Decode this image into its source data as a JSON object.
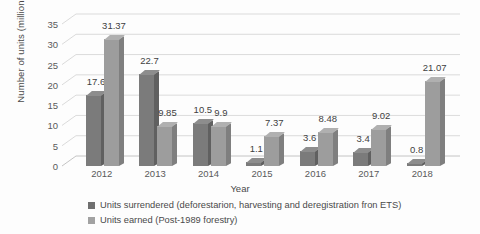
{
  "chart_data": {
    "type": "bar",
    "title": "",
    "xlabel": "Year",
    "ylabel": "Number of units (millions)",
    "categories": [
      "2012",
      "2013",
      "2014",
      "2015",
      "2016",
      "2017",
      "2018"
    ],
    "series": [
      {
        "name": "Units surrendered (deforestarion, harvesting and deregistration fron ETS)",
        "color": "#7b7b7b",
        "values": [
          17.6,
          22.7,
          10.5,
          1.1,
          3.6,
          3.4,
          0.8
        ],
        "labels": [
          "17.6",
          "22.7",
          "10.5",
          "1.1",
          "3.6",
          "3.4",
          "0.8"
        ]
      },
      {
        "name": "Units earned (Post-1989 forestry)",
        "color": "#9d9d9d",
        "values": [
          31.37,
          9.85,
          9.9,
          7.37,
          8.48,
          9.02,
          21.07
        ],
        "labels": [
          "31.37",
          "9.85",
          "9.9",
          "7.37",
          "8.48",
          "9.02",
          "21.07"
        ]
      }
    ],
    "ylim": [
      0,
      35
    ],
    "yticks": [
      0,
      5,
      10,
      15,
      20,
      25,
      30,
      35
    ],
    "yticklabels": [
      "0",
      "5",
      "10",
      "15",
      "20",
      "25",
      "30",
      "35"
    ],
    "grid": true,
    "legend_position": "bottom",
    "style": "3d-clustered-column"
  }
}
